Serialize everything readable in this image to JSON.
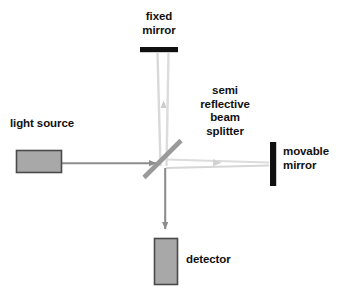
{
  "diagram": {
    "background_color": "#ffffff",
    "labels": {
      "fixed_mirror": "fixed\nmirror",
      "beam_splitter": "semi\nreflective\nbeam\nsplitter",
      "light_source": "light source",
      "movable_mirror": "movable\nmirror",
      "detector": "detector"
    },
    "colors": {
      "text": "#111111",
      "mirror_black": "#101010",
      "box_fill": "#a8a8a8",
      "box_border": "#4a4a4a",
      "beam_strong": "#8d8d8d",
      "beam_faint": "#d8d8d8",
      "splitter": "#9a9a9a"
    },
    "components": {
      "fixed_mirror": {
        "shape": "horizontal-bar",
        "x": 140,
        "y": 47,
        "width": 38,
        "height": 5
      },
      "movable_mirror": {
        "shape": "vertical-bar",
        "x": 270,
        "y": 142,
        "width": 6,
        "height": 44
      },
      "light_source_box": {
        "shape": "rectangle",
        "x": 16,
        "y": 150,
        "width": 46,
        "height": 23
      },
      "detector_box": {
        "shape": "rectangle",
        "x": 154,
        "y": 238,
        "width": 24,
        "height": 47
      },
      "beam_splitter": {
        "shape": "diagonal-bar",
        "x1": 144,
        "y1": 177,
        "x2": 181,
        "y2": 140,
        "angle_deg": 45
      }
    },
    "beams": {
      "source_to_splitter": {
        "from": [
          62,
          163
        ],
        "to": [
          161,
          163
        ],
        "arrow": "right",
        "intensity": "strong"
      },
      "splitter_to_fixed_mirror": {
        "from": [
          163,
          160
        ],
        "to": [
          163,
          53
        ],
        "arrow": "up",
        "intensity": "faint"
      },
      "splitter_to_movable_mirror": {
        "from": [
          168,
          165
        ],
        "to": [
          269,
          163
        ],
        "arrow": "right",
        "intensity": "faint"
      },
      "splitter_to_detector": {
        "from": [
          165,
          168
        ],
        "to": [
          165,
          236
        ],
        "arrow": "down",
        "intensity": "strong"
      }
    }
  }
}
